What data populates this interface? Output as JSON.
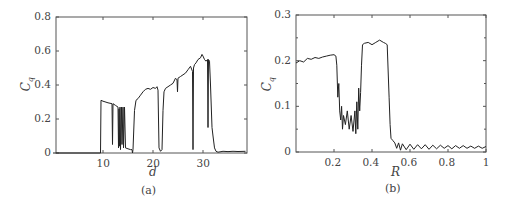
{
  "chart_data": [
    {
      "id": "a",
      "type": "line",
      "caption": "(a)",
      "xlabel": "d",
      "ylabel": "C_q",
      "ylabel_main": "C",
      "ylabel_sub": "q",
      "xlim": [
        0,
        38.5
      ],
      "ylim": [
        0,
        0.8
      ],
      "xticks": [
        10,
        20,
        30
      ],
      "xtick_labels": [
        "10",
        "20",
        "30"
      ],
      "yticks": [
        0,
        0.2,
        0.4,
        0.6,
        0.8
      ],
      "ytick_labels": [
        "0",
        "0.2",
        "0.4",
        "0.6",
        "0.8"
      ],
      "grid": false,
      "x": [
        0,
        5,
        9.5,
        9.6,
        10,
        11,
        11.8,
        11.9,
        12.0,
        12.5,
        13.0,
        13.1,
        13.2,
        13.3,
        13.4,
        13.5,
        13.7,
        13.8,
        14.0,
        14.1,
        14.3,
        14.5,
        15.0,
        15.5,
        15.8,
        15.9,
        16.0,
        16.3,
        16.6,
        17,
        17.5,
        18,
        18.5,
        19,
        19.5,
        20,
        20.5,
        20.8,
        21.0,
        21.2,
        21.5,
        21.8,
        22.0,
        22.2,
        22.5,
        23,
        23.5,
        24,
        24.5,
        24.8,
        24.9,
        25.0,
        25.5,
        26,
        26.5,
        27,
        27.5,
        27.9,
        28.0,
        28.1,
        28.3,
        28.6,
        29,
        29.5,
        29.8,
        30.0,
        30.3,
        30.6,
        30.9,
        31.0,
        31.1,
        31.3,
        31.5,
        31.8,
        32.0,
        32.3,
        32.6,
        33,
        34,
        35,
        36,
        37,
        38.5
      ],
      "values": [
        0,
        0,
        0,
        0.31,
        0.305,
        0.295,
        0.29,
        0.05,
        0.29,
        0.28,
        0.27,
        0.03,
        0.26,
        0.04,
        0.27,
        0.02,
        0.27,
        0.05,
        0.27,
        0.03,
        0.27,
        0.03,
        0.025,
        0.02,
        0.02,
        0.0,
        0.02,
        0.25,
        0.31,
        0.32,
        0.34,
        0.36,
        0.375,
        0.38,
        0.375,
        0.385,
        0.38,
        0.39,
        0.37,
        0.03,
        0.01,
        0.02,
        0.25,
        0.36,
        0.38,
        0.39,
        0.4,
        0.41,
        0.44,
        0.43,
        0.36,
        0.44,
        0.45,
        0.46,
        0.47,
        0.49,
        0.51,
        0.48,
        0.02,
        0.5,
        0.52,
        0.53,
        0.55,
        0.56,
        0.58,
        0.57,
        0.55,
        0.54,
        0.55,
        0.15,
        0.55,
        0.54,
        0.4,
        0.15,
        0.1,
        0.03,
        0.01,
        0.005,
        0.01,
        0.008,
        0.01,
        0.009,
        0.01
      ]
    },
    {
      "id": "b",
      "type": "line",
      "caption": "(b)",
      "xlabel": "R",
      "ylabel": "C_q",
      "ylabel_main": "C",
      "ylabel_sub": "q",
      "xlim": [
        0,
        1
      ],
      "ylim": [
        0,
        0.3
      ],
      "xticks": [
        0.2,
        0.4,
        0.6,
        0.8,
        1
      ],
      "xtick_labels": [
        "0.2",
        "0.4",
        "0.6",
        "0.8",
        "1"
      ],
      "yticks": [
        0,
        0.1,
        0.2,
        0.3
      ],
      "ytick_labels": [
        "0",
        "0.1",
        "0.2",
        "0.3"
      ],
      "grid": false,
      "x": [
        0,
        0.02,
        0.04,
        0.06,
        0.08,
        0.1,
        0.12,
        0.14,
        0.16,
        0.18,
        0.2,
        0.21,
        0.215,
        0.22,
        0.225,
        0.23,
        0.235,
        0.24,
        0.245,
        0.25,
        0.26,
        0.27,
        0.28,
        0.29,
        0.3,
        0.31,
        0.315,
        0.32,
        0.325,
        0.33,
        0.335,
        0.34,
        0.345,
        0.35,
        0.36,
        0.38,
        0.4,
        0.42,
        0.44,
        0.46,
        0.47,
        0.48,
        0.49,
        0.495,
        0.5,
        0.51,
        0.52,
        0.53,
        0.54,
        0.55,
        0.56,
        0.58,
        0.6,
        0.62,
        0.64,
        0.66,
        0.68,
        0.7,
        0.72,
        0.74,
        0.76,
        0.78,
        0.8,
        0.82,
        0.84,
        0.86,
        0.88,
        0.9,
        0.92,
        0.94,
        0.96,
        0.98,
        1.0
      ],
      "values": [
        0.195,
        0.2,
        0.197,
        0.205,
        0.203,
        0.207,
        0.205,
        0.208,
        0.21,
        0.212,
        0.213,
        0.21,
        0.19,
        0.12,
        0.15,
        0.09,
        0.07,
        0.1,
        0.05,
        0.08,
        0.06,
        0.09,
        0.05,
        0.08,
        0.045,
        0.09,
        0.04,
        0.11,
        0.05,
        0.14,
        0.09,
        0.13,
        0.19,
        0.235,
        0.238,
        0.24,
        0.235,
        0.24,
        0.245,
        0.24,
        0.238,
        0.235,
        0.12,
        0.06,
        0.03,
        0.025,
        0.02,
        0.008,
        0.02,
        0.004,
        0.018,
        0.005,
        0.017,
        0.006,
        0.016,
        0.007,
        0.016,
        0.006,
        0.015,
        0.007,
        0.015,
        0.008,
        0.014,
        0.007,
        0.014,
        0.008,
        0.014,
        0.008,
        0.013,
        0.008,
        0.013,
        0.008,
        0.012
      ]
    }
  ]
}
